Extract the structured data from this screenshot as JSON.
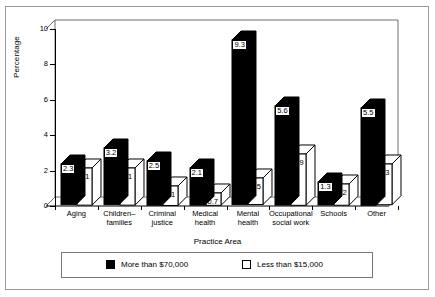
{
  "chart_data": {
    "type": "bar",
    "title": "",
    "xlabel": "Practice Area",
    "ylabel": "Percentage",
    "ylim": [
      0,
      10
    ],
    "yticks": [
      0,
      2,
      4,
      6,
      8,
      10
    ],
    "grid": false,
    "legend_position": "bottom",
    "categories": [
      "Aging",
      "Children–families",
      "Criminal justice",
      "Medical health",
      "Mental health",
      "Occupational social work",
      "Schools",
      "Other"
    ],
    "category_lines": [
      [
        "Aging"
      ],
      [
        "Children–",
        "families"
      ],
      [
        "Criminal",
        "justice"
      ],
      [
        "Medical",
        "health"
      ],
      [
        "Mental",
        "health"
      ],
      [
        "Occupational",
        "social work"
      ],
      [
        "Schools"
      ],
      [
        "Other"
      ]
    ],
    "series": [
      {
        "name": "More than $70,000",
        "color": "#000000",
        "values": [
          2.3,
          3.2,
          2.5,
          2.1,
          9.3,
          5.6,
          1.3,
          5.5
        ],
        "labels": [
          "2.3",
          "3.2",
          "2.5",
          "2.1",
          "9.3",
          "5.6",
          "1.3",
          "5.5"
        ]
      },
      {
        "name": "Less than $15,000",
        "color": "#ffffff",
        "values": [
          2.1,
          2.1,
          1.1,
          0.7,
          1.5,
          2.9,
          1.2,
          2.3
        ],
        "labels": [
          "2.1",
          "2.1",
          "1.1",
          "0.7",
          "1.5",
          "2.9",
          "1.2",
          "2.3"
        ]
      }
    ]
  },
  "axis": {
    "y_title": "Percentage",
    "x_title": "Practice Area",
    "y_tick_labels": [
      "0",
      "2",
      "4",
      "6",
      "8",
      "10"
    ]
  },
  "legend": {
    "items": [
      {
        "label": "More than $70,000",
        "swatch": "dark"
      },
      {
        "label": "Less than $15,000",
        "swatch": "light"
      }
    ]
  }
}
